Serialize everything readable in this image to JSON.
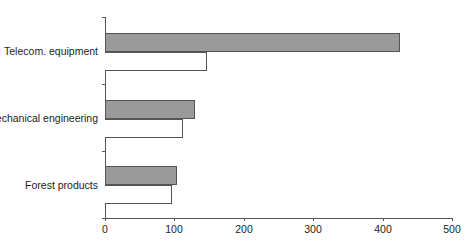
{
  "chart_data": {
    "type": "bar",
    "orientation": "horizontal",
    "title": "",
    "xlabel": "",
    "ylabel": "",
    "categories": [
      "Telecom. equipment",
      "Mechanical engineering",
      "Forest products"
    ],
    "series": [
      {
        "name": "Series 1 (shaded)",
        "color": "#9a9a9a",
        "values": [
          425,
          130,
          104
        ]
      },
      {
        "name": "Series 2 (outline)",
        "color": "#ffffff",
        "values": [
          147,
          112,
          97
        ]
      }
    ],
    "xlim": [
      0,
      500
    ],
    "xticks": [
      "0",
      "100",
      "200",
      "300",
      "400",
      "500"
    ],
    "grid": false,
    "legend": "none"
  },
  "labels": {
    "cat0": "Telecom. equipment",
    "cat1": "Mechanical engineering",
    "cat2": "Forest products",
    "tick0": "0",
    "tick1": "100",
    "tick2": "200",
    "tick3": "300",
    "tick4": "400",
    "tick5": "500"
  }
}
